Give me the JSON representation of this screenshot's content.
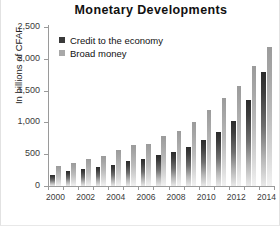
{
  "chart_data": {
    "type": "bar",
    "title": "Monetary Developments",
    "xlabel": "",
    "ylabel": "In billions of CFAF",
    "ylim": [
      0,
      2500
    ],
    "ytick_labels": [
      "0",
      "500",
      "1,000",
      "1,500",
      "2,000",
      "2,500"
    ],
    "ytick_values": [
      0,
      500,
      1000,
      1500,
      2000,
      2500
    ],
    "grid": false,
    "legend_position": "top-left",
    "categories": [
      "2000",
      "2001",
      "2002",
      "2003",
      "2004",
      "2005",
      "2006",
      "2007",
      "2008",
      "2009",
      "2010",
      "2011",
      "2012",
      "2013",
      "2014"
    ],
    "xtick_labels": [
      "2000",
      "2002",
      "2004",
      "2006",
      "2008",
      "2010",
      "2012",
      "2014"
    ],
    "series": [
      {
        "name": "Credit to the economy",
        "color": "#3a3a3a",
        "values": [
          180,
          230,
          270,
          300,
          330,
          390,
          430,
          480,
          540,
          610,
          720,
          850,
          1020,
          1350,
          1800
        ]
      },
      {
        "name": "Broad money",
        "color": "#a8a8a8",
        "values": [
          310,
          360,
          420,
          470,
          560,
          640,
          660,
          780,
          860,
          1010,
          1190,
          1380,
          1570,
          1880,
          2180
        ]
      }
    ]
  },
  "legend": {
    "items": [
      {
        "label": "Credit to the economy",
        "swatch": "credit-swatch"
      },
      {
        "label": "Broad money",
        "swatch": "broad-money-swatch"
      }
    ]
  }
}
